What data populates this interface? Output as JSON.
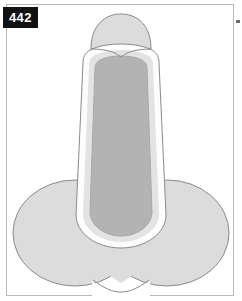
{
  "figure": {
    "number_label": "442",
    "background_color": "#ffffff",
    "frame": {
      "border_color": "#b9b9b9",
      "border_width_px": 1,
      "fill_color": "#ffffff",
      "x": 6,
      "y": 4,
      "width": 228,
      "height": 292
    },
    "badge": {
      "text": "442",
      "background_color": "#111111",
      "text_color": "#ffffff",
      "x": 3,
      "y": 7,
      "width": 35,
      "height": 21
    },
    "edge_mark": {
      "color": "#6e6e6e",
      "x": 236,
      "y": 20,
      "width": 4,
      "height": 3
    },
    "palette": {
      "outline": "#8a8a8a",
      "lobe_fill": "#dcdcdc",
      "cap_fill": "#dcdcdc",
      "halo_fill": "#fdfdfd",
      "shaft_band_fill": "#e3e3e3",
      "shaft_core_fill": "#b3b3b3",
      "shaft_core_edge": "#a8a8a8"
    },
    "parts": [
      {
        "name": "domed-cap",
        "description": "Rounded dome forming the top terminal of the shaft, meeting the shaft in a shallow downward V at its base",
        "fill": "#dcdcdc",
        "stroke": "#8a8a8a"
      },
      {
        "name": "left-lobe",
        "description": "Large rounded lobe at lower left of the base",
        "fill": "#dcdcdc",
        "stroke": "#8a8a8a",
        "center_x": 75,
        "center_y": 233,
        "radius_x": 62,
        "radius_y": 53
      },
      {
        "name": "right-lobe",
        "description": "Large rounded lobe at lower right of the base overlapping the left lobe",
        "fill": "#dcdcdc",
        "stroke": "#8a8a8a",
        "center_x": 167,
        "center_y": 233,
        "radius_x": 62,
        "radius_y": 53
      },
      {
        "name": "shaft-halo",
        "description": "White band wrapping the vertical shaft and descending in a U shape into the base lobes",
        "fill": "#fdfdfd",
        "stroke": "#8a8a8a"
      },
      {
        "name": "shaft-outer-band",
        "description": "Light gray band between the white halo and the darker core of the shaft",
        "fill": "#e3e3e3"
      },
      {
        "name": "shaft-core",
        "description": "Medium gray inner column running the full height of the shaft, ending in a rounded U at the bottom",
        "fill": "#b3b3b3",
        "stroke": "#a8a8a8"
      }
    ]
  }
}
